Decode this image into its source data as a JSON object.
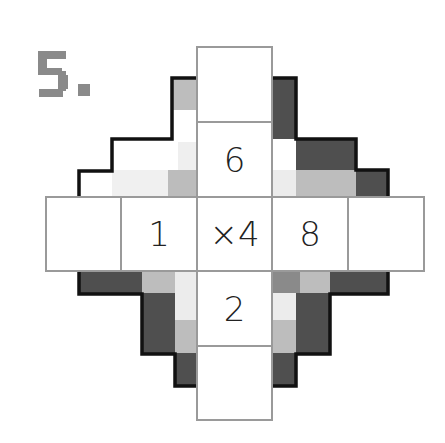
{
  "puzzle": {
    "number_label": "5.",
    "colors": {
      "dark": "#505050",
      "medium": "#8a8a8a",
      "light": "#bdbdbd",
      "very_light": "#ececec",
      "outline": "#111111",
      "grid_line": "#9a9a9a",
      "label": "#8a8a8a"
    },
    "vertical_cells": [
      {
        "row": 0,
        "value": ""
      },
      {
        "row": 1,
        "value": "6"
      },
      {
        "row": 3,
        "value": "2"
      },
      {
        "row": 4,
        "value": ""
      }
    ],
    "horizontal_cells": [
      {
        "col": 0,
        "value": ""
      },
      {
        "col": 1,
        "value": "1"
      },
      {
        "col": 2,
        "value": "×4"
      },
      {
        "col": 3,
        "value": "8"
      },
      {
        "col": 4,
        "value": ""
      }
    ]
  }
}
